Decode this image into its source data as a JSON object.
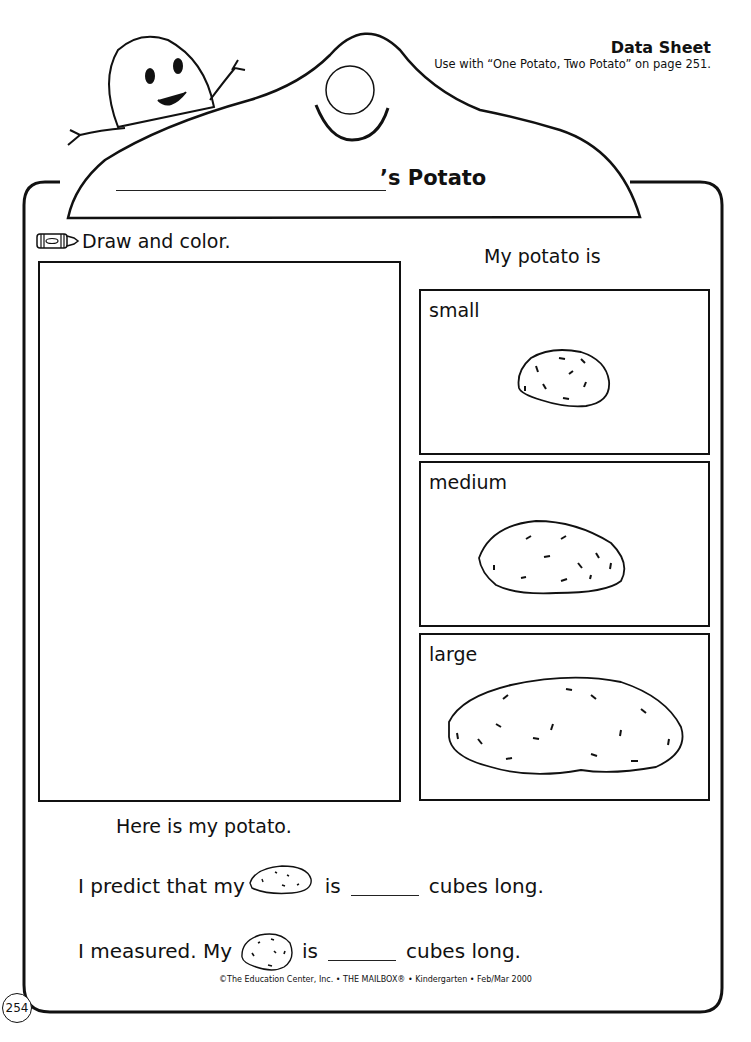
{
  "header": {
    "title": "Data Sheet",
    "subtitle": "Use with “One Potato, Two Potato” on page 251."
  },
  "sheet": {
    "title_suffix": "’s Potato",
    "name_blank": "",
    "draw_instruction": "Draw and color.",
    "draw_icon": "crayon-icon",
    "size_prompt": "My potato is",
    "size_options": [
      {
        "label": "small"
      },
      {
        "label": "medium"
      },
      {
        "label": "large"
      }
    ],
    "drawing_caption": "Here is my potato.",
    "predict": {
      "prefix": "I predict that my",
      "mid": "is",
      "suffix": "cubes long.",
      "value": ""
    },
    "measured": {
      "prefix": "I measured. My",
      "mid": "is",
      "suffix": "cubes long.",
      "value": ""
    }
  },
  "footer": {
    "copyright": "©The Education Center, Inc. • THE MAILBOX® • Kindergarten • Feb/Mar 2000",
    "page_number": "254"
  }
}
